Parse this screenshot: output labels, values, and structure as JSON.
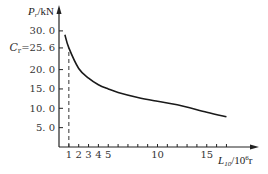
{
  "chart_data": {
    "type": "line",
    "title": "",
    "xlabel": "L10/10^6 r",
    "ylabel": "Pr/kN",
    "xlabel_parts": {
      "main": "L",
      "sub": "10",
      "rest": "/10",
      "sup": "6",
      "unit": "r"
    },
    "ylabel_parts": {
      "main": "P",
      "sub": "r",
      "rest": "/kN"
    },
    "xlim": [
      0,
      19
    ],
    "ylim": [
      0,
      33
    ],
    "grid": false,
    "x_ticks": [
      1,
      2,
      3,
      4,
      5,
      6,
      7,
      8,
      9,
      10,
      11,
      12,
      13,
      14,
      15,
      16,
      17
    ],
    "x_tick_labels": [
      {
        "value": 1,
        "label": "1"
      },
      {
        "value": 2,
        "label": "2"
      },
      {
        "value": 3,
        "label": "3"
      },
      {
        "value": 4,
        "label": "4"
      },
      {
        "value": 5,
        "label": "5"
      },
      {
        "value": 10,
        "label": "10"
      },
      {
        "value": 15,
        "label": "15"
      }
    ],
    "y_tick_labels": [
      {
        "value": 5.0,
        "label": "5. 0"
      },
      {
        "value": 10.0,
        "label": "10. 0"
      },
      {
        "value": 15.0,
        "label": "15. 0"
      },
      {
        "value": 20.0,
        "label": "20. 0"
      },
      {
        "value": 25.6,
        "label": "Cr=25. 6",
        "prefix": "C",
        "prefix_sub": "r",
        "text": "=25. 6"
      },
      {
        "value": 30.0,
        "label": "30. 0"
      }
    ],
    "series": [
      {
        "name": "Pr vs L10",
        "x": [
          0.6,
          1,
          2,
          3,
          4,
          5,
          6,
          8,
          10,
          12,
          15,
          17
        ],
        "y": [
          29.0,
          25.6,
          20.3,
          17.8,
          16.1,
          15.0,
          14.1,
          12.8,
          11.8,
          10.9,
          9.0,
          7.8
        ]
      }
    ],
    "annotations": [
      {
        "type": "dashed-line",
        "description": "vertical dashed line at L10=1 from axis up to Cr=25.6",
        "x": 1,
        "y_from": 0,
        "y_to": 25.6
      }
    ]
  },
  "colors": {
    "curve": "#1a1a1a",
    "axis": "#222222",
    "text": "#333333"
  }
}
